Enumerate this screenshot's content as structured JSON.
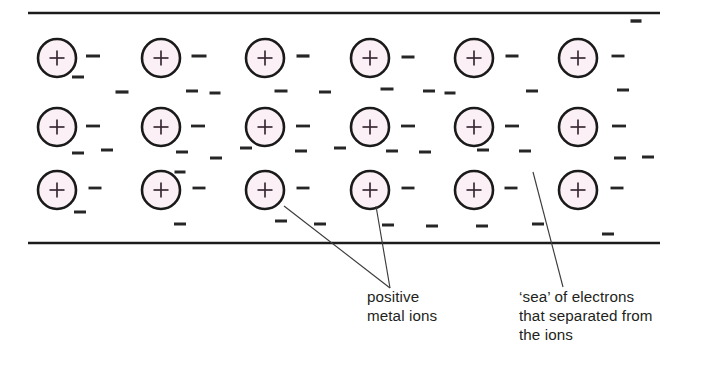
{
  "diagram": {
    "colors": {
      "ion_fill": "#faf0f5",
      "ion_stroke": "#1a1a1a",
      "electron_stroke": "#262626",
      "boundary_stroke": "#1c1c1c",
      "leader_stroke": "#3c3c3c",
      "text": "#231f20",
      "background": "#ffffff"
    },
    "boundaries": [
      {
        "name": "top-boundary",
        "x1": 28,
        "y1": 13,
        "x2": 660,
        "y2": 13
      },
      {
        "name": "bottom-boundary",
        "x1": 28,
        "y1": 243,
        "x2": 660,
        "y2": 243
      }
    ],
    "ion_symbol": "+",
    "ion_radius": 19,
    "ion_rows": [
      {
        "row": 1,
        "cy": 58,
        "cx": [
          57,
          161,
          265,
          370,
          474,
          578
        ]
      },
      {
        "row": 2,
        "cy": 127,
        "cx": [
          57,
          161,
          265,
          370,
          474,
          578
        ]
      },
      {
        "row": 3,
        "cy": 190,
        "cx": [
          57,
          161,
          265,
          370,
          474,
          578
        ]
      }
    ],
    "electron_symbol": "−",
    "electrons": [
      {
        "x": 93,
        "y": 56,
        "w": 14,
        "sw": 3.0
      },
      {
        "x": 199,
        "y": 56,
        "w": 15,
        "sw": 3.0
      },
      {
        "x": 303,
        "y": 56,
        "w": 13,
        "sw": 3.2
      },
      {
        "x": 408,
        "y": 57,
        "w": 13,
        "sw": 3.0
      },
      {
        "x": 512,
        "y": 56,
        "w": 13,
        "sw": 3.0
      },
      {
        "x": 618,
        "y": 56,
        "w": 13,
        "sw": 2.8
      },
      {
        "x": 636,
        "y": 21,
        "w": 11,
        "sw": 3.4
      },
      {
        "x": 78,
        "y": 77,
        "w": 12,
        "sw": 3.0
      },
      {
        "x": 122,
        "y": 92,
        "w": 13,
        "sw": 3.2
      },
      {
        "x": 192,
        "y": 91,
        "w": 12,
        "sw": 3.0
      },
      {
        "x": 215,
        "y": 93,
        "w": 11,
        "sw": 3.0
      },
      {
        "x": 281,
        "y": 91,
        "w": 13,
        "sw": 3.0
      },
      {
        "x": 325,
        "y": 92,
        "w": 12,
        "sw": 3.0
      },
      {
        "x": 387,
        "y": 89,
        "w": 13,
        "sw": 3.0
      },
      {
        "x": 429,
        "y": 91,
        "w": 12,
        "sw": 3.0
      },
      {
        "x": 450,
        "y": 93,
        "w": 11,
        "sw": 3.0
      },
      {
        "x": 532,
        "y": 91,
        "w": 12,
        "sw": 3.0
      },
      {
        "x": 623,
        "y": 90,
        "w": 12,
        "sw": 3.0
      },
      {
        "x": 93,
        "y": 126,
        "w": 14,
        "sw": 2.8
      },
      {
        "x": 198,
        "y": 126,
        "w": 14,
        "sw": 2.8
      },
      {
        "x": 303,
        "y": 126,
        "w": 14,
        "sw": 2.8
      },
      {
        "x": 408,
        "y": 126,
        "w": 14,
        "sw": 2.8
      },
      {
        "x": 512,
        "y": 126,
        "w": 14,
        "sw": 2.8
      },
      {
        "x": 619,
        "y": 126,
        "w": 14,
        "sw": 2.8
      },
      {
        "x": 78,
        "y": 153,
        "w": 12,
        "sw": 3.0
      },
      {
        "x": 107,
        "y": 150,
        "w": 12,
        "sw": 3.0
      },
      {
        "x": 182,
        "y": 152,
        "w": 12,
        "sw": 3.0
      },
      {
        "x": 216,
        "y": 158,
        "w": 12,
        "sw": 3.0
      },
      {
        "x": 246,
        "y": 148,
        "w": 12,
        "sw": 3.0
      },
      {
        "x": 301,
        "y": 151,
        "w": 12,
        "sw": 3.0
      },
      {
        "x": 340,
        "y": 148,
        "w": 12,
        "sw": 3.0
      },
      {
        "x": 392,
        "y": 151,
        "w": 12,
        "sw": 3.0
      },
      {
        "x": 425,
        "y": 152,
        "w": 12,
        "sw": 3.0
      },
      {
        "x": 483,
        "y": 150,
        "w": 12,
        "sw": 3.0
      },
      {
        "x": 525,
        "y": 151,
        "w": 12,
        "sw": 3.0
      },
      {
        "x": 620,
        "y": 158,
        "w": 12,
        "sw": 3.0
      },
      {
        "x": 648,
        "y": 157,
        "w": 12,
        "sw": 3.0
      },
      {
        "x": 95,
        "y": 188,
        "w": 13,
        "sw": 2.8
      },
      {
        "x": 199,
        "y": 188,
        "w": 13,
        "sw": 2.8
      },
      {
        "x": 303,
        "y": 188,
        "w": 13,
        "sw": 2.8
      },
      {
        "x": 408,
        "y": 188,
        "w": 13,
        "sw": 2.8
      },
      {
        "x": 511,
        "y": 188,
        "w": 13,
        "sw": 2.8
      },
      {
        "x": 617,
        "y": 188,
        "w": 13,
        "sw": 2.8
      },
      {
        "x": 180,
        "y": 172,
        "w": 11,
        "sw": 3.0
      },
      {
        "x": 80,
        "y": 212,
        "w": 12,
        "sw": 3.0
      },
      {
        "x": 180,
        "y": 224,
        "w": 12,
        "sw": 3.0
      },
      {
        "x": 281,
        "y": 221,
        "w": 12,
        "sw": 3.0
      },
      {
        "x": 320,
        "y": 224,
        "w": 12,
        "sw": 3.0
      },
      {
        "x": 388,
        "y": 225,
        "w": 12,
        "sw": 3.0
      },
      {
        "x": 432,
        "y": 226,
        "w": 12,
        "sw": 3.0
      },
      {
        "x": 482,
        "y": 226,
        "w": 12,
        "sw": 3.0
      },
      {
        "x": 538,
        "y": 224,
        "w": 12,
        "sw": 3.0
      },
      {
        "x": 608,
        "y": 234,
        "w": 12,
        "sw": 3.0
      }
    ],
    "leaders": [
      {
        "name": "leader-ion-left",
        "x1": 284,
        "y1": 206,
        "x2": 390,
        "y2": 288
      },
      {
        "name": "leader-ion-right",
        "x1": 376,
        "y1": 206,
        "x2": 390,
        "y2": 288
      },
      {
        "name": "leader-electron-sea",
        "x1": 533,
        "y1": 172,
        "x2": 563,
        "y2": 287
      }
    ],
    "callouts": [
      {
        "name": "callout-positive-metal-ions",
        "x": 367,
        "y": 302,
        "line_height": 19,
        "lines": [
          "positive",
          "metal ions"
        ]
      },
      {
        "name": "callout-sea-of-electrons",
        "x": 519,
        "y": 302,
        "line_height": 19,
        "lines": [
          "‘sea’ of electrons",
          "that separated from",
          "the ions"
        ]
      }
    ]
  }
}
